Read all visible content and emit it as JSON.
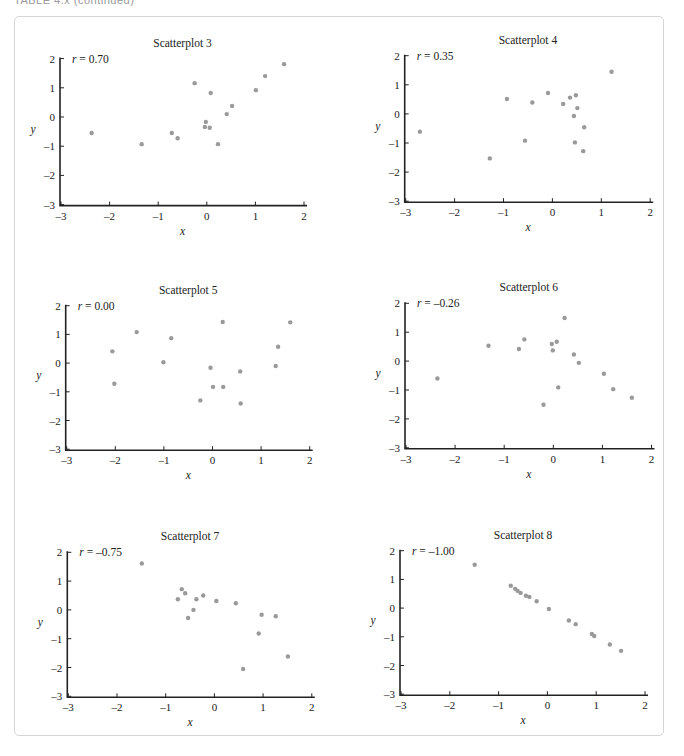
{
  "page": {
    "caption": "TABLE 4.x (continued)"
  },
  "chart_data": [
    {
      "type": "scatter",
      "title": "Scatterplot 3",
      "annotation": "r = 0.70",
      "r": "0.70",
      "xlabel": "x",
      "ylabel": "y",
      "xlim": [
        -3,
        2
      ],
      "ylim": [
        -3,
        2
      ],
      "xticks": [
        -3,
        -2,
        -1,
        0,
        1,
        2
      ],
      "yticks": [
        -3,
        -2,
        -1,
        0,
        1,
        2
      ],
      "grid": false,
      "points": [
        [
          -2.37,
          -0.55
        ],
        [
          -1.34,
          -0.93
        ],
        [
          -0.72,
          -0.55
        ],
        [
          -0.6,
          -0.73
        ],
        [
          -0.25,
          1.16
        ],
        [
          -0.02,
          -0.17
        ],
        [
          -0.04,
          -0.34
        ],
        [
          0.06,
          -0.37
        ],
        [
          0.08,
          0.82
        ],
        [
          0.23,
          -0.93
        ],
        [
          0.41,
          0.1
        ],
        [
          0.52,
          0.38
        ],
        [
          1.01,
          0.92
        ],
        [
          1.2,
          1.4
        ],
        [
          1.59,
          1.81
        ]
      ]
    },
    {
      "type": "scatter",
      "title": "Scatterplot 4",
      "annotation": "r = 0.35",
      "r": "0.35",
      "xlabel": "x",
      "ylabel": "y",
      "xlim": [
        -3,
        2
      ],
      "ylim": [
        -3,
        2
      ],
      "xticks": [
        -3,
        -2,
        -1,
        0,
        1,
        2
      ],
      "yticks": [
        -3,
        -2,
        -1,
        0,
        1,
        2
      ],
      "grid": false,
      "points": [
        [
          -2.71,
          -0.61
        ],
        [
          -1.28,
          -1.53
        ],
        [
          -0.93,
          0.51
        ],
        [
          -0.56,
          -0.92
        ],
        [
          -0.41,
          0.39
        ],
        [
          -0.09,
          0.72
        ],
        [
          0.22,
          0.34
        ],
        [
          0.36,
          0.56
        ],
        [
          0.48,
          0.64
        ],
        [
          0.51,
          0.2
        ],
        [
          0.44,
          -0.07
        ],
        [
          0.65,
          -0.46
        ],
        [
          0.46,
          -0.98
        ],
        [
          0.63,
          -1.28
        ],
        [
          1.21,
          1.45
        ]
      ]
    },
    {
      "type": "scatter",
      "title": "Scatterplot 5",
      "annotation": "r = 0.00",
      "r": "0.00",
      "xlabel": "x",
      "ylabel": "y",
      "xlim": [
        -3,
        2
      ],
      "ylim": [
        -3,
        2
      ],
      "xticks": [
        -3,
        -2,
        -1,
        0,
        1,
        2
      ],
      "yticks": [
        -3,
        -2,
        -1,
        0,
        1,
        2
      ],
      "grid": false,
      "points": [
        [
          -2.06,
          0.41
        ],
        [
          -2.02,
          -0.72
        ],
        [
          -1.56,
          1.08
        ],
        [
          -1.01,
          0.03
        ],
        [
          -0.85,
          0.87
        ],
        [
          -0.25,
          -1.3
        ],
        [
          -0.04,
          -0.16
        ],
        [
          0.01,
          -0.83
        ],
        [
          0.21,
          1.43
        ],
        [
          0.22,
          -0.83
        ],
        [
          0.57,
          -0.29
        ],
        [
          0.58,
          -1.41
        ],
        [
          1.3,
          -0.1
        ],
        [
          1.35,
          0.57
        ],
        [
          1.6,
          1.42
        ]
      ]
    },
    {
      "type": "scatter",
      "title": "Scatterplot 6",
      "annotation": "r = –0.26",
      "r": "–0.26",
      "xlabel": "x",
      "ylabel": "y",
      "xlim": [
        -3,
        2
      ],
      "ylim": [
        -3,
        2
      ],
      "xticks": [
        -3,
        -2,
        -1,
        0,
        1,
        2
      ],
      "yticks": [
        -3,
        -2,
        -1,
        0,
        1,
        2
      ],
      "grid": false,
      "points": [
        [
          -2.36,
          -0.6
        ],
        [
          -1.32,
          0.53
        ],
        [
          -0.7,
          0.42
        ],
        [
          -0.59,
          0.75
        ],
        [
          -0.2,
          -1.51
        ],
        [
          -0.03,
          0.59
        ],
        [
          -0.01,
          0.37
        ],
        [
          0.07,
          0.67
        ],
        [
          0.1,
          -0.91
        ],
        [
          0.23,
          1.49
        ],
        [
          0.42,
          0.23
        ],
        [
          0.52,
          -0.06
        ],
        [
          1.03,
          -0.44
        ],
        [
          1.22,
          -0.97
        ],
        [
          1.6,
          -1.27
        ]
      ]
    },
    {
      "type": "scatter",
      "title": "Scatterplot 7",
      "annotation": "r = –0.75",
      "r": "–0.75",
      "xlabel": "x",
      "ylabel": "y",
      "xlim": [
        -3,
        2
      ],
      "ylim": [
        -3,
        2
      ],
      "xticks": [
        -3,
        -2,
        -1,
        0,
        1,
        2
      ],
      "yticks": [
        -3,
        -2,
        -1,
        0,
        1,
        2
      ],
      "grid": false,
      "points": [
        [
          -1.49,
          1.61
        ],
        [
          -0.75,
          0.37
        ],
        [
          -0.67,
          0.72
        ],
        [
          -0.6,
          0.58
        ],
        [
          -0.54,
          -0.28
        ],
        [
          -0.43,
          0.0
        ],
        [
          -0.37,
          0.37
        ],
        [
          -0.23,
          0.5
        ],
        [
          0.04,
          0.31
        ],
        [
          0.44,
          0.23
        ],
        [
          0.59,
          -2.05
        ],
        [
          0.91,
          -0.82
        ],
        [
          0.97,
          -0.17
        ],
        [
          1.26,
          -0.22
        ],
        [
          1.51,
          -1.62
        ]
      ]
    },
    {
      "type": "scatter",
      "title": "Scatterplot 8",
      "annotation": "r = –1.00",
      "r": "–1.00",
      "xlabel": "x",
      "ylabel": "y",
      "xlim": [
        -3,
        2
      ],
      "ylim": [
        -3,
        2
      ],
      "xticks": [
        -3,
        -2,
        -1,
        0,
        1,
        2
      ],
      "yticks": [
        -3,
        -2,
        -1,
        0,
        1,
        2
      ],
      "grid": false,
      "points": [
        [
          -1.49,
          1.51
        ],
        [
          -0.75,
          0.78
        ],
        [
          -0.66,
          0.67
        ],
        [
          -0.61,
          0.6
        ],
        [
          -0.55,
          0.53
        ],
        [
          -0.44,
          0.43
        ],
        [
          -0.37,
          0.39
        ],
        [
          -0.22,
          0.24
        ],
        [
          0.03,
          -0.03
        ],
        [
          0.44,
          -0.43
        ],
        [
          0.58,
          -0.56
        ],
        [
          0.91,
          -0.9
        ],
        [
          0.96,
          -0.97
        ],
        [
          1.28,
          -1.27
        ],
        [
          1.51,
          -1.49
        ]
      ]
    }
  ],
  "layout": {
    "panels": [
      {
        "x0": 61,
        "yTop": 58.6,
        "xScale": 48.6,
        "yScale": 29.2
      },
      {
        "x0": 405.7,
        "yTop": 55.7,
        "xScale": 48.9,
        "yScale": 29.1
      },
      {
        "x0": 66.7,
        "yTop": 305.7,
        "xScale": 48.6,
        "yScale": 28.7
      },
      {
        "x0": 406,
        "yTop": 303.3,
        "xScale": 49.1,
        "yScale": 28.9
      },
      {
        "x0": 68.3,
        "yTop": 552.3,
        "xScale": 48.7,
        "yScale": 28.8
      },
      {
        "x0": 401,
        "yTop": 550.7,
        "xScale": 48.8,
        "yScale": 28.7
      }
    ]
  }
}
